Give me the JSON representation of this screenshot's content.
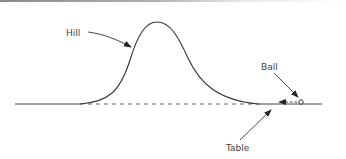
{
  "diagram": {
    "labels": {
      "hill": "Hill",
      "ball": "Ball",
      "table": "Table"
    },
    "colors": {
      "stroke": "#333333",
      "text": "#444444"
    }
  }
}
